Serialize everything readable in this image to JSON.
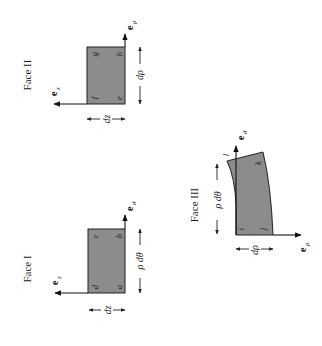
{
  "figure": {
    "orientation": "rotated-90-ccw",
    "colors": {
      "face_fill": "#8c8c8c",
      "ink": "#1a1a1a",
      "background": "#ffffff"
    },
    "faces": [
      {
        "id": "face-1",
        "title": "Face I",
        "corners": [
          "a",
          "b",
          "c",
          "d"
        ],
        "axis_horizontal": {
          "symbol": "e",
          "subscript": "z"
        },
        "axis_vertical": {
          "symbol": "e",
          "subscript": "θ"
        },
        "dim_horizontal": "dz",
        "dim_vertical": "ρ dθ"
      },
      {
        "id": "face-2",
        "title": "Face II",
        "corners": [
          "e",
          "f",
          "g",
          "h"
        ],
        "axis_horizontal": {
          "symbol": "e",
          "subscript": "z"
        },
        "axis_vertical": {
          "symbol": "e",
          "subscript": "ρ"
        },
        "dim_horizontal": "dz",
        "dim_vertical": "dρ"
      },
      {
        "id": "face-3",
        "title": "Face III",
        "corners": [
          "i",
          "j",
          "k",
          "l"
        ],
        "axis_vertical": {
          "symbol": "e",
          "subscript": "θ"
        },
        "axis_horizontal": {
          "symbol": "e",
          "subscript": "ρ"
        },
        "dim_horizontal": "dρ",
        "dim_vertical": "ρ dθ"
      }
    ]
  }
}
